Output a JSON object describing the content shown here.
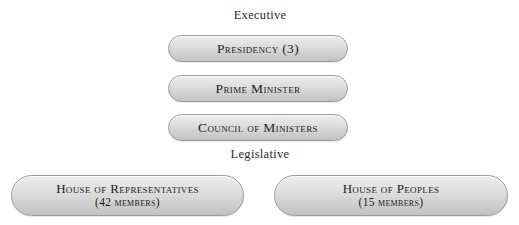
{
  "diagram": {
    "colors": {
      "background": "#ffffff",
      "node_border": "#9a9a9a",
      "node_fill_top": "#ededed",
      "node_fill_bottom": "#c2c2c2",
      "text": "#1c1c20",
      "heading_text": "#2a2a2a"
    },
    "sections": [
      {
        "id": "executive",
        "heading": "Executive",
        "nodes": [
          {
            "id": "presidency",
            "label": "Presidency (3)"
          },
          {
            "id": "prime-minister",
            "label": "Prime Minister"
          },
          {
            "id": "council",
            "label": "Council of Ministers"
          }
        ]
      },
      {
        "id": "legislative",
        "heading": "Legislative",
        "nodes": [
          {
            "id": "house-of-representatives",
            "label": "House of Representatives",
            "sub_label": "(42 members)",
            "member_count": 42
          },
          {
            "id": "house-of-peoples",
            "label": "House of Peoples",
            "sub_label": "(15 members)",
            "member_count": 15
          }
        ]
      }
    ]
  }
}
